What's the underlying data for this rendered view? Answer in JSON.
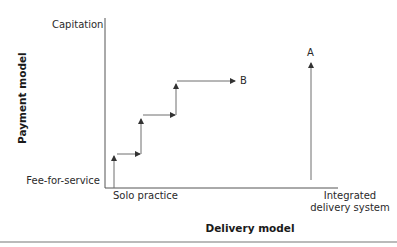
{
  "figure": {
    "y_axis": {
      "title": "Payment model",
      "top_label": "Capitation",
      "bottom_label": "Fee-for-service"
    },
    "x_axis": {
      "title": "Delivery model",
      "left_label": "Solo practice",
      "right_label_line1": "Integrated",
      "right_label_line2": "delivery system"
    },
    "paths": {
      "A": {
        "label": "A",
        "description": "Vertical path at integrated delivery system from fee-for-service up toward capitation"
      },
      "B": {
        "label": "B",
        "description": "Staircase path from solo practice/fee-for-service stepping up and right toward capitation"
      }
    },
    "colors": {
      "line": "#6e6e6e",
      "axis": "#555555",
      "text": "#2a2a2a"
    }
  }
}
